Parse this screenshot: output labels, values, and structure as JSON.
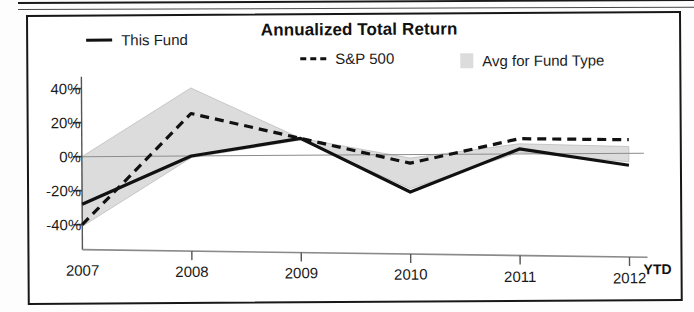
{
  "chart_data": {
    "type": "line",
    "title": "Annualized Total Return",
    "xlabel": "",
    "ylabel": "",
    "categories": [
      "2007",
      "2008",
      "2009",
      "2010",
      "2011",
      "2012"
    ],
    "x_axis_note": "YTD",
    "ylim": [
      -50,
      45
    ],
    "ytick_labels": [
      "40%",
      "20%",
      "0%",
      "-20%",
      "-40%"
    ],
    "ytick_values": [
      40,
      20,
      0,
      -20,
      -40
    ],
    "grid": false,
    "zero_line": true,
    "legend_position": "top",
    "series": [
      {
        "name": "This Fund",
        "style": "solid",
        "color": "#111111",
        "values": [
          -28,
          0,
          10,
          -22,
          3,
          -7
        ]
      },
      {
        "name": "S&P 500",
        "style": "dashed",
        "color": "#111111",
        "values": [
          -40,
          25,
          10,
          -5,
          9,
          8
        ]
      },
      {
        "name": "Avg for Fund Type",
        "style": "band",
        "color": "#dcdcdc",
        "upper": [
          0,
          40,
          10,
          -2,
          6,
          4
        ],
        "lower": [
          -41,
          -1,
          9,
          -20,
          1,
          -5
        ]
      }
    ]
  },
  "legend": {
    "fund_label": "This Fund",
    "sp_label": "S&P 500",
    "avg_label": "Avg for Fund Type"
  },
  "axis": {
    "y_labels": [
      "40%",
      "20%",
      "0%",
      "-20%",
      "-40%"
    ],
    "x_labels": [
      "2007",
      "2008",
      "2009",
      "2010",
      "2011",
      "2012"
    ],
    "ytd": "YTD"
  },
  "colors": {
    "line": "#111111",
    "band": "#dcdcdc",
    "axis": "#555555",
    "frame": "#171717"
  }
}
